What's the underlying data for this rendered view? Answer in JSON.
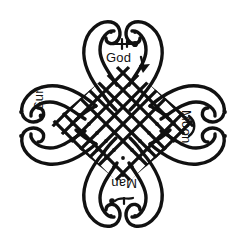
{
  "figure": {
    "background_color": "#ffffff",
    "stroke_color": "#111111",
    "dot_color": "#111111"
  },
  "labels": {
    "god": "God",
    "sun": "Sun",
    "moon": "Moon",
    "man": "Man"
  },
  "glyphs": {
    "god_symbol": "key-pin-icon",
    "god_arrow": "arrow-down-icon",
    "sun_symbol": "sun-dot-icon",
    "moon_symbol": "crescent-moon-icon",
    "man_symbol": "man-squiggle-icon"
  },
  "lattice": {
    "description": "Diagonal grid of rounded diamond cells, each containing a center dot",
    "cell_size": 17,
    "rows": 9,
    "columns": 9
  },
  "lobes": [
    {
      "name": "top",
      "label_ref": "god",
      "tip_dots": 2
    },
    {
      "name": "left",
      "label_ref": "sun",
      "tip_dots": 2
    },
    {
      "name": "right",
      "label_ref": "moon",
      "tip_dots": 2
    },
    {
      "name": "bottom",
      "label_ref": "man",
      "tip_dots": 2
    }
  ]
}
